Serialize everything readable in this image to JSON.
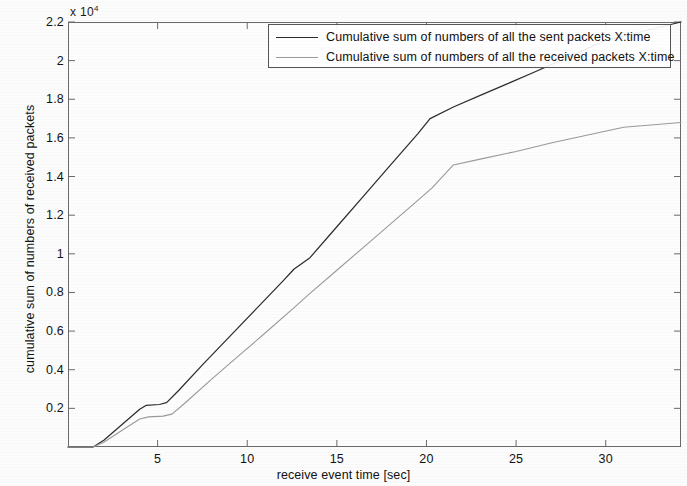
{
  "chart_data": {
    "type": "line",
    "title": "",
    "xlabel": "receive event time [sec]",
    "ylabel": "cumulative sum of numbers of received packets",
    "y_exponent_label": "x 10",
    "y_exponent_power": "4",
    "xlim": [
      0,
      34.2
    ],
    "ylim": [
      0,
      22000
    ],
    "xticks": [
      5,
      10,
      15,
      20,
      25,
      30
    ],
    "xtick_labels": [
      "5",
      "10",
      "15",
      "20",
      "25",
      "30"
    ],
    "yticks": [
      2000,
      4000,
      6000,
      8000,
      10000,
      12000,
      14000,
      16000,
      18000,
      20000,
      22000
    ],
    "ytick_labels": [
      "0.2",
      "0.4",
      "0.6",
      "0.8",
      "1",
      "1.2",
      "1.4",
      "1.6",
      "1.8",
      "2",
      "2.2"
    ],
    "grid": false,
    "legend_position": "top-center",
    "series": [
      {
        "name": "Cumulative sum of numbers of all the sent packets X:time",
        "color": "#2d2d2d",
        "style": "solid",
        "x": [
          0,
          1.4,
          2.0,
          3.0,
          4.0,
          4.35,
          5.1,
          5.5,
          6.2,
          7.5,
          9.0,
          10.5,
          12.0,
          12.6,
          13.5,
          15.0,
          16.5,
          18.0,
          19.5,
          20.2,
          21.5,
          23.0,
          24.5,
          26.0,
          27.2,
          30.0,
          34.2
        ],
        "y": [
          0,
          0,
          350,
          1150,
          1950,
          2150,
          2200,
          2300,
          2950,
          4250,
          5700,
          7150,
          8600,
          9200,
          9800,
          11400,
          13000,
          14600,
          16200,
          17000,
          17600,
          18200,
          18800,
          19400,
          19900,
          21050,
          22000
        ]
      },
      {
        "name": "Cumulative sum of numbers of all the received packets X:time",
        "color": "#9a9a9a",
        "style": "solid-light",
        "x": [
          0,
          1.4,
          2.0,
          3.0,
          4.0,
          4.5,
          5.3,
          5.8,
          6.5,
          8.0,
          9.5,
          11.0,
          12.6,
          13.5,
          15.0,
          16.5,
          18.0,
          19.5,
          20.3,
          21.5,
          23.0,
          25.0,
          27.0,
          29.0,
          31.0,
          34.2
        ],
        "y": [
          0,
          0,
          250,
          850,
          1450,
          1560,
          1600,
          1700,
          2250,
          3500,
          4700,
          5900,
          7200,
          7950,
          9150,
          10350,
          11550,
          12750,
          13400,
          14600,
          14900,
          15300,
          15750,
          16150,
          16550,
          16800
        ]
      }
    ]
  },
  "legend": {
    "entries": [
      {
        "label": "Cumulative sum of numbers of all the sent packets X:time"
      },
      {
        "label": "Cumulative sum of numbers of all the received packets X:time"
      }
    ]
  }
}
